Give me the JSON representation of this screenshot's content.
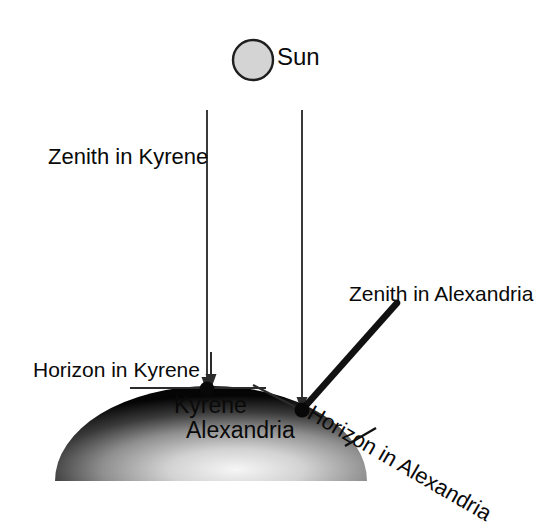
{
  "diagram": {
    "background_color": "#ffffff",
    "line_color": "#2b2b2b",
    "text_color": "#0a0a0a"
  },
  "sun": {
    "label": "Sun",
    "icon": "sun-circle",
    "fill_color": "#d4d4d4",
    "stroke_color": "#1f1f1f",
    "center_x": 253,
    "center_y": 60,
    "radius": 20
  },
  "rays": [
    {
      "name": "ray-to-kyrene",
      "x": 207,
      "y_start": 110,
      "y_end": 388,
      "arrowhead": true
    },
    {
      "name": "ray-to-alexandria",
      "x": 302,
      "y_start": 110,
      "y_end": 408,
      "arrowhead": true
    }
  ],
  "labels": {
    "zenith_kyrene": "Zenith in Kyrene",
    "zenith_alexandria": "Zenith in Alexandria",
    "horizon_kyrene": "Horizon in Kyrene",
    "horizon_alexandria": "Horizon in Alexandria",
    "kyrene": "Kyrene",
    "alexandria": "Alexandria"
  },
  "earth": {
    "name": "earth-dome",
    "shape": "semicircle",
    "center_x": 211,
    "base_y": 481,
    "radius_x": 156,
    "radius_y": 95,
    "gradient": {
      "edge_color": "#0a0a0a",
      "mid_color": "#8a8a8a",
      "light_color": "#f2f2f2"
    }
  },
  "cities": [
    {
      "name": "kyrene-point",
      "label": "Kyrene",
      "x": 207,
      "y": 389,
      "dot_radius": 7
    },
    {
      "name": "alexandria-point",
      "label": "Alexandria",
      "x": 302,
      "y": 410,
      "dot_radius": 7
    }
  ],
  "horizon_lines": [
    {
      "name": "horizon-line-kyrene",
      "x1": 130,
      "y1": 388,
      "x2": 266,
      "y2": 388,
      "thickness": 2
    },
    {
      "name": "horizon-line-alexandria-tangent",
      "x1": 255,
      "y1": 386,
      "x2": 312,
      "y2": 415,
      "thickness": 2
    },
    {
      "name": "horizon-underline-alexandria",
      "x1": 346,
      "y1": 444,
      "x2": 374,
      "y2": 428,
      "thickness": 2
    }
  ],
  "zenith_line_alexandria": {
    "name": "zenith-line-alexandria",
    "x1": 302,
    "y1": 410,
    "x2": 397,
    "y2": 303,
    "thickness": 6
  }
}
